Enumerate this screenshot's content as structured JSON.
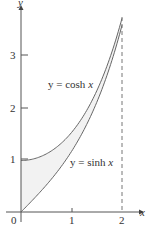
{
  "chart_data": {
    "type": "line",
    "title": "",
    "xlabel": "x",
    "ylabel": "y",
    "xlim": [
      0,
      2
    ],
    "ylim": [
      0,
      3.8
    ],
    "x_ticks": [
      "0",
      "1",
      "2"
    ],
    "y_ticks": [
      "1",
      "2",
      "3"
    ],
    "grid": false,
    "series": [
      {
        "name": "y = cosh x",
        "function": "cosh",
        "x": [
          0,
          0.25,
          0.5,
          0.75,
          1,
          1.25,
          1.5,
          1.75,
          2
        ],
        "values": [
          1.0,
          1.03,
          1.13,
          1.29,
          1.54,
          1.89,
          2.35,
          2.96,
          3.76
        ]
      },
      {
        "name": "y = sinh x",
        "function": "sinh",
        "x": [
          0,
          0.25,
          0.5,
          0.75,
          1,
          1.25,
          1.5,
          1.75,
          2
        ],
        "values": [
          0.0,
          0.25,
          0.52,
          0.82,
          1.18,
          1.6,
          2.13,
          2.79,
          3.63
        ]
      }
    ],
    "annotations": [
      {
        "text": "y = cosh x",
        "near": "upper curve"
      },
      {
        "text": "y = sinh x",
        "near": "lower curve"
      },
      {
        "type": "shaded_region",
        "between": [
          "cosh x",
          "sinh x"
        ],
        "x_range": [
          0,
          2
        ]
      },
      {
        "type": "dashed_vertical_line",
        "x": 2
      }
    ]
  },
  "labels": {
    "x_axis": "x",
    "y_axis": "y",
    "origin": "0",
    "xt1": "1",
    "xt2": "2",
    "yt1": "1",
    "yt2": "2",
    "yt3": "3",
    "cosh_prefix": "y = cosh ",
    "cosh_var": "x",
    "sinh_prefix": "y = sinh ",
    "sinh_var": "x"
  }
}
